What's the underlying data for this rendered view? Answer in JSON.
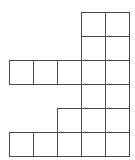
{
  "diagram": {
    "type": "polyomino-grid",
    "cell_size": 24,
    "origin": {
      "x": 9,
      "y": 12
    },
    "line_color": "#4a4a4a",
    "rows": 6,
    "cols": 5,
    "cells": [
      [
        3,
        0
      ],
      [
        4,
        0
      ],
      [
        3,
        1
      ],
      [
        4,
        1
      ],
      [
        0,
        2
      ],
      [
        1,
        2
      ],
      [
        2,
        2
      ],
      [
        3,
        2
      ],
      [
        4,
        2
      ],
      [
        3,
        3
      ],
      [
        4,
        3
      ],
      [
        2,
        4
      ],
      [
        3,
        4
      ],
      [
        4,
        4
      ],
      [
        0,
        5
      ],
      [
        1,
        5
      ],
      [
        2,
        5
      ],
      [
        3,
        5
      ],
      [
        4,
        5
      ]
    ],
    "cell_count": 19
  }
}
